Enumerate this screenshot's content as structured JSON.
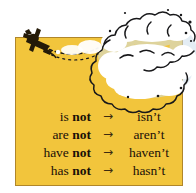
{
  "illustration": {
    "title": "negative-contractions-skywriting",
    "panel_color": "#f2c53c",
    "panel_border_color": "#b0862a",
    "background_color": "#ffffff",
    "cloud_color": "#ffffff",
    "cloud_outline_color": "#1a1a1a",
    "cloud_shadow_color": "#b9cddd",
    "plane_color": "#241a08",
    "plane_label": "skywriting-airplane",
    "cloud_label": "smoke-trail-cloud"
  },
  "table": {
    "arrow": "→",
    "rows": [
      {
        "base": "is ",
        "negative": "not",
        "arrow": "→",
        "contraction": "isn’t"
      },
      {
        "base": "are ",
        "negative": "not",
        "arrow": "→",
        "contraction": "aren’t"
      },
      {
        "base": "have ",
        "negative": "not",
        "arrow": "→",
        "contraction": "haven’t"
      },
      {
        "base": "has ",
        "negative": "not",
        "arrow": "→",
        "contraction": "hasn’t"
      }
    ]
  }
}
